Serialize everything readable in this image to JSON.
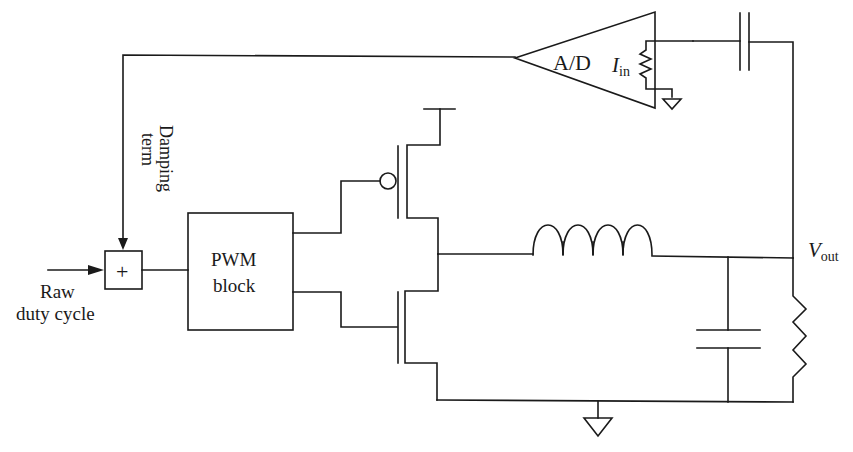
{
  "diagram": {
    "title": "",
    "labels": {
      "ad_converter": "A/D",
      "current_symbol": "I",
      "current_subscript": "in",
      "damping_line1": "Damping",
      "damping_line2": "term",
      "sum_symbol": "+",
      "raw_line1": "Raw",
      "raw_line2": "duty cycle",
      "pwm_line1": "PWM",
      "pwm_line2": "block",
      "vout_symbol": "V",
      "vout_subscript": "out"
    },
    "components": [
      {
        "id": "summing-junction",
        "type": "adder"
      },
      {
        "id": "pwm-block",
        "type": "block"
      },
      {
        "id": "pmos-switch",
        "type": "pmos"
      },
      {
        "id": "nmos-switch",
        "type": "nmos"
      },
      {
        "id": "inductor",
        "type": "inductor"
      },
      {
        "id": "output-capacitor",
        "type": "capacitor"
      },
      {
        "id": "load-resistor",
        "type": "resistor"
      },
      {
        "id": "coupling-capacitor",
        "type": "capacitor"
      },
      {
        "id": "ad-converter",
        "type": "amplifier"
      },
      {
        "id": "sense-resistor",
        "type": "resistor"
      },
      {
        "id": "ground",
        "type": "ground"
      }
    ],
    "colors": {
      "line": "#1a1a1a",
      "background": "#ffffff"
    }
  }
}
